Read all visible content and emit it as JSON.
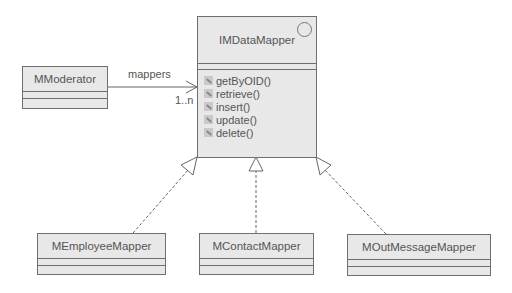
{
  "diagram": {
    "type": "UML class diagram",
    "interface": {
      "name": "IMDataMapper",
      "stereotype_icon": "interface-circle-icon",
      "operations": [
        "getByOID()",
        "retrieve()",
        "insert()",
        "update()",
        "delete()"
      ],
      "operation_icon": "operation-icon"
    },
    "client": {
      "name": "MModerator"
    },
    "association": {
      "role": "mappers",
      "multiplicity": "1..n"
    },
    "implementations": [
      {
        "name": "MEmployeeMapper"
      },
      {
        "name": "MContactMapper"
      },
      {
        "name": "MOutMessageMapper"
      }
    ]
  }
}
